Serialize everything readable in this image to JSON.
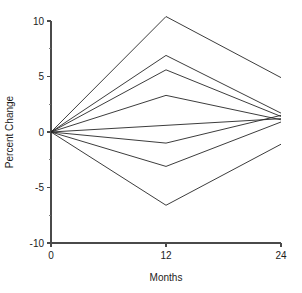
{
  "chart_data": {
    "type": "line",
    "title": "",
    "xlabel": "Months",
    "ylabel": "Percent Change",
    "x": [
      0,
      12,
      24
    ],
    "xlim": [
      0,
      24
    ],
    "ylim": [
      -10,
      10
    ],
    "xticks": [
      0,
      12,
      24
    ],
    "xtick_labels": [
      "0",
      "12",
      "24"
    ],
    "yticks": [
      -10,
      -5,
      0,
      5,
      10
    ],
    "ytick_labels": [
      "-10",
      "-5",
      "0",
      "5",
      "10"
    ],
    "yticks_minor": [
      -7.5,
      -2.5,
      2.5,
      7.5
    ],
    "grid": false,
    "legend": false,
    "line_color": "#262626",
    "axis_color": "#4a4a4a",
    "series": [
      {
        "name": "Series 1",
        "values": [
          0,
          10.4,
          4.9
        ]
      },
      {
        "name": "Series 2",
        "values": [
          0,
          6.9,
          1.7
        ]
      },
      {
        "name": "Series 3",
        "values": [
          0,
          5.6,
          1.4
        ]
      },
      {
        "name": "Series 4",
        "values": [
          0,
          3.3,
          1.1
        ]
      },
      {
        "name": "Series 5",
        "values": [
          0,
          0.6,
          1.2
        ]
      },
      {
        "name": "Series 6",
        "values": [
          0,
          -1.0,
          1.5
        ]
      },
      {
        "name": "Series 7",
        "values": [
          0,
          -3.1,
          0.9
        ]
      },
      {
        "name": "Series 8",
        "values": [
          0,
          -6.6,
          -1.1
        ]
      }
    ]
  },
  "geometry": {
    "plot_left": 51,
    "plot_right": 281,
    "plot_top": 21,
    "plot_bottom": 243,
    "tick_len_major": 4,
    "tick_len_minor": 2.5
  }
}
